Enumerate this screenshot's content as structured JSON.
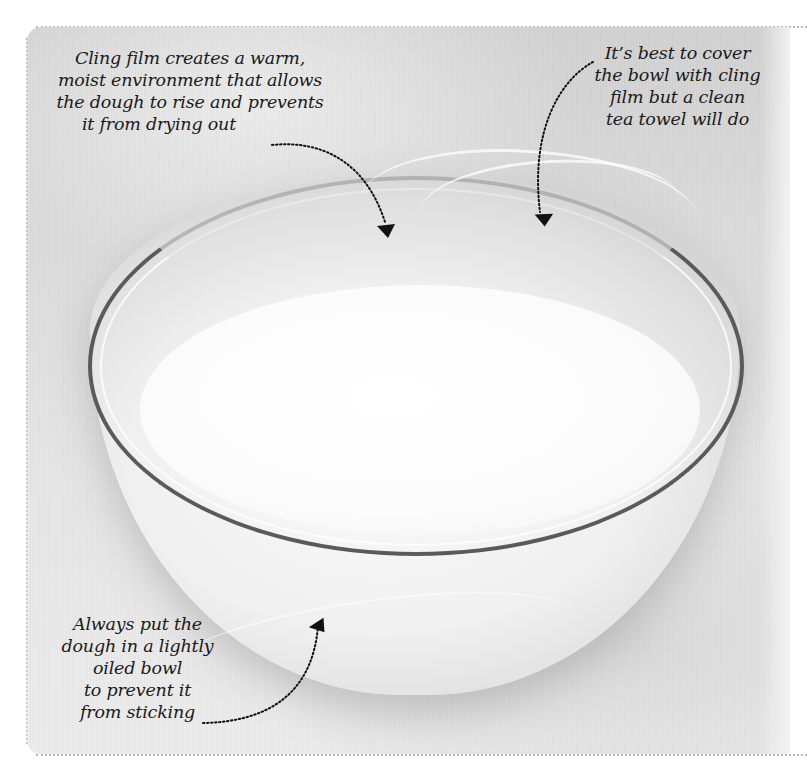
{
  "figure": {
    "colors": {
      "background": "#ffffff",
      "photo_tone": "#dcdcdc",
      "frame_dots": "#b8b8b8",
      "annotation_text": "#1a1a1a",
      "arrow": "#111111",
      "bowl_rim": "#5a5a5a"
    }
  },
  "annotations": {
    "cling_film": {
      "lines": [
        "Cling film creates a warm,",
        "moist environment that allows",
        "the dough to rise and prevents",
        "it from drying out"
      ],
      "arrow_icon": "dotted-curved-arrow"
    },
    "cover_bowl": {
      "lines": [
        "It’s best to cover",
        "the bowl with cling",
        "film but a clean",
        "tea towel will do"
      ],
      "arrow_icon": "dotted-curved-arrow"
    },
    "oiled_bowl": {
      "lines": [
        "Always put the",
        "dough in a lightly",
        "oiled bowl",
        "to prevent it",
        "from sticking"
      ],
      "arrow_icon": "dotted-curved-arrow"
    }
  }
}
